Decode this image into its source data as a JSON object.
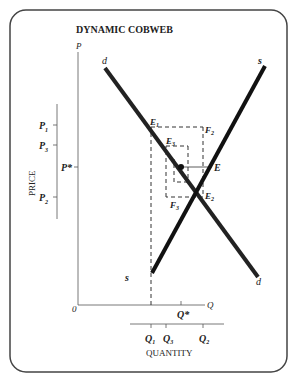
{
  "title": "DYNAMIC COBWEB",
  "axes": {
    "y_label": "P",
    "x_label": "Q",
    "origin": "0",
    "price_label": "PRICE",
    "quantity_label": "QUANTITY"
  },
  "curves": {
    "demand": "d",
    "supply": "s"
  },
  "price_ticks": [
    {
      "label": "P",
      "sub": "1"
    },
    {
      "label": "P",
      "sub": "3"
    },
    {
      "label": "P*",
      "sub": ""
    },
    {
      "label": "P",
      "sub": "2"
    }
  ],
  "quantity_ticks": [
    {
      "label": "Q",
      "sub": "1"
    },
    {
      "label": "Q",
      "sub": "3"
    },
    {
      "label": "Q",
      "sub": "2"
    }
  ],
  "q_star": "Q*",
  "points": {
    "E1": "E1",
    "F2": "F2",
    "E3": "E3",
    "E": "E",
    "F3": "F3",
    "E2": "E2"
  },
  "colors": {
    "curve": "#222222",
    "frame": "#444444"
  }
}
